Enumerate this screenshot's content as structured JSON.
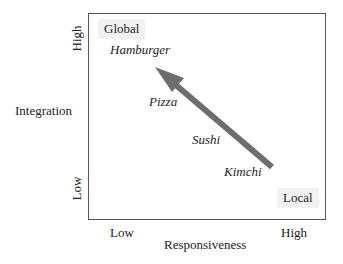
{
  "diagram": {
    "type": "2x2 strategy matrix",
    "x_axis": {
      "title": "Responsiveness",
      "low_label": "Low",
      "high_label": "High"
    },
    "y_axis": {
      "title": "Integration",
      "low_label": "Low",
      "high_label": "High"
    },
    "corners": {
      "top_left": "Global",
      "bottom_right": "Local"
    },
    "items": [
      {
        "label": "Hamburger"
      },
      {
        "label": "Pizza"
      },
      {
        "label": "Sushi"
      },
      {
        "label": "Kimchi"
      }
    ],
    "arrow": {
      "from": "Kimchi (high responsiveness, low integration)",
      "to": "Hamburger (low responsiveness, high integration)",
      "color": "#6e6e6e"
    },
    "colors": {
      "frame": "#555555",
      "corner_label_bg": "#f2f2f2",
      "text": "#222222"
    }
  }
}
